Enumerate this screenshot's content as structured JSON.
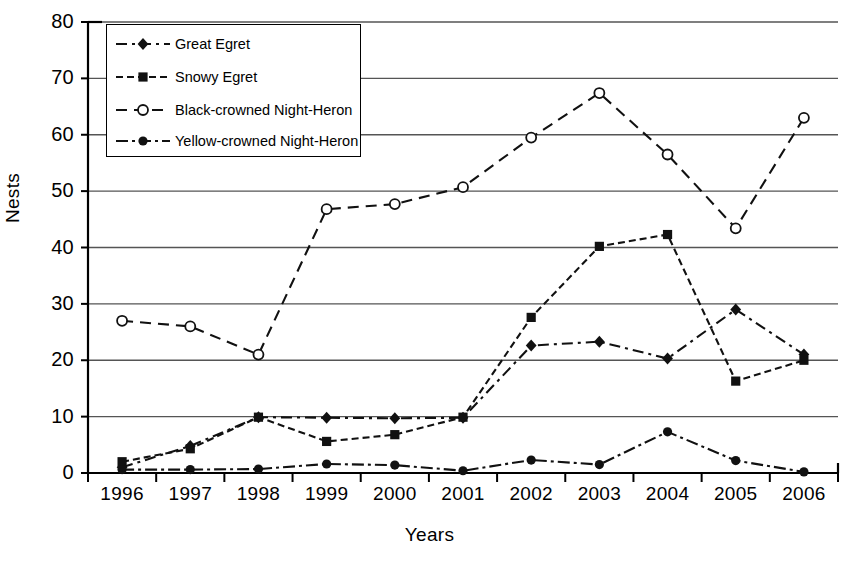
{
  "chart_data": {
    "type": "line",
    "title": "",
    "xlabel": "Years",
    "ylabel": "Nests",
    "categories": [
      "1996",
      "1997",
      "1998",
      "1999",
      "2000",
      "2001",
      "2002",
      "2003",
      "2004",
      "2005",
      "2006"
    ],
    "x": [
      1996,
      1997,
      1998,
      1999,
      2000,
      2001,
      2002,
      2003,
      2004,
      2005,
      2006
    ],
    "ylim": [
      0,
      80
    ],
    "yticks": [
      0,
      10,
      20,
      30,
      40,
      50,
      60,
      70,
      80
    ],
    "grid": true,
    "legend_position": "top-left",
    "series": [
      {
        "name": "Great Egret",
        "marker": "diamond",
        "values": [
          1.0,
          4.8,
          9.9,
          9.8,
          9.7,
          9.8,
          22.6,
          23.3,
          20.3,
          29.0,
          21.0
        ]
      },
      {
        "name": "Snowy Egret",
        "marker": "square",
        "values": [
          2.0,
          4.3,
          9.9,
          5.6,
          6.8,
          9.9,
          27.6,
          40.2,
          42.3,
          16.3,
          20.0
        ]
      },
      {
        "name": "Black-crowned Night-Heron",
        "marker": "open-circle",
        "values": [
          27.0,
          26.0,
          21.0,
          46.8,
          47.7,
          50.7,
          59.5,
          67.4,
          56.5,
          43.4,
          63.0
        ]
      },
      {
        "name": "Yellow-crowned Night-Heron",
        "marker": "filled-circle",
        "values": [
          0.6,
          0.6,
          0.7,
          1.6,
          1.4,
          0.4,
          2.3,
          1.5,
          7.3,
          2.2,
          0.2
        ]
      }
    ]
  },
  "legend": {
    "items": [
      {
        "label": "Great Egret"
      },
      {
        "label": "Snowy Egret"
      },
      {
        "label": "Black-crowned Night-Heron"
      },
      {
        "label": "Yellow-crowned Night-Heron"
      }
    ]
  },
  "colors": {
    "axis": "#000000",
    "grid": "#555555",
    "series": "#111111",
    "background": "#ffffff"
  }
}
